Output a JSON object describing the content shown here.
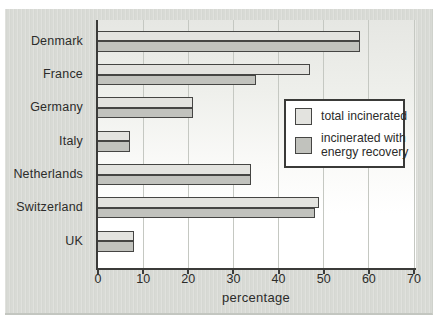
{
  "chart_data": {
    "type": "bar",
    "orientation": "horizontal",
    "categories": [
      "Denmark",
      "France",
      "Germany",
      "Italy",
      "Netherlands",
      "Switzerland",
      "UK"
    ],
    "series": [
      {
        "name": "total incinerated",
        "label_lines": [
          "total incinerated"
        ],
        "color": "#e3e3df",
        "values": [
          58,
          47,
          21,
          7,
          34,
          49,
          8
        ]
      },
      {
        "name": "incinerated with energy recovery",
        "label_lines": [
          "incinerated with",
          "energy recovery"
        ],
        "color": "#c1c2bd",
        "values": [
          58,
          35,
          21,
          7,
          34,
          48,
          8
        ]
      }
    ],
    "xlabel": "percentage",
    "xlim": [
      0,
      70
    ],
    "xticks": [
      0,
      10,
      20,
      30,
      40,
      50,
      60,
      70
    ],
    "grid": true,
    "legend_position": "inside right"
  },
  "colors": {
    "panel_bg": "#d8dad5",
    "plot_bg_top": "#e6e7e3",
    "plot_bg_bottom": "#ffffff",
    "bar_light": "#e3e3df",
    "bar_dark": "#c1c2bd",
    "axis": "#3b3b39",
    "gridline": "#c5c8c2",
    "text": "#2c2c2a"
  }
}
